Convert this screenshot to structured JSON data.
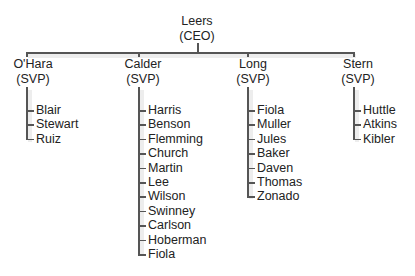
{
  "ceo": {
    "name": "Leers",
    "title": "(CEO)"
  },
  "svps": [
    {
      "name": "O'Hara",
      "title": "(SVP)",
      "reports": [
        "Blair",
        "Stewart",
        "Ruiz"
      ]
    },
    {
      "name": "Calder",
      "title": "(SVP)",
      "reports": [
        "Harris",
        "Benson",
        "Flemming",
        "Church",
        "Martin",
        "Lee",
        "Wilson",
        "Swinney",
        "Carlson",
        "Hoberman",
        "Fiola"
      ]
    },
    {
      "name": "Long",
      "title": "(SVP)",
      "reports": [
        "Fiola",
        "Muller",
        "Jules",
        "Baker",
        "Daven",
        "Thomas",
        "Zonado"
      ]
    },
    {
      "name": "Stern",
      "title": "(SVP)",
      "reports": [
        "Huttle",
        "Atkins",
        "Kibler"
      ]
    }
  ],
  "colors": {
    "line": "#555555",
    "text": "#222222",
    "background": "#ffffff"
  }
}
